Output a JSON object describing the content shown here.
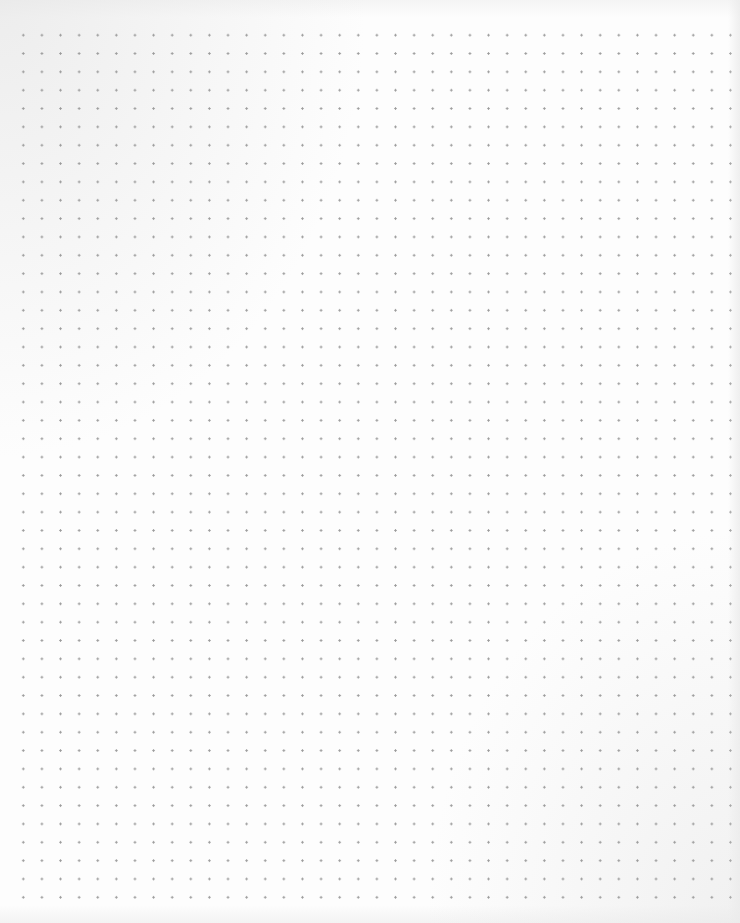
{
  "page": {
    "type": "dot-grid-paper",
    "background_color": "#fdfdfd",
    "dot_color": "#9a9a9a",
    "grid": {
      "columns": 38,
      "rows": 47,
      "spacing_px": 18.6
    },
    "text": ""
  }
}
